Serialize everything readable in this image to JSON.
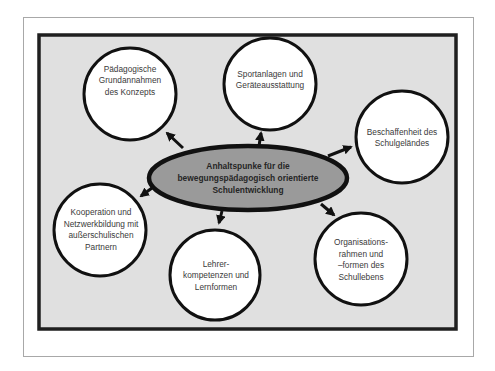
{
  "diagram": {
    "type": "mind-map",
    "colors": {
      "frame_border": "#a8a8a8",
      "panel_border": "#1f1f1f",
      "panel_fill": "#e0e0e0",
      "node_fill": "#ffffff",
      "node_stroke": "#111111",
      "center_fill": "#9a9a9a",
      "text": "#3a3a3a"
    },
    "center": {
      "label": "Anhaltspunke für die\nbewegungspädagogisch orientierte\nSchulentwicklung"
    },
    "nodes": [
      {
        "id": "paedagogische",
        "label": "Pädagogische\nGrundannahmen\ndes Konzepts"
      },
      {
        "id": "sportanlagen",
        "label": "Sportanlagen und\nGeräteausstattung"
      },
      {
        "id": "beschaffenheit",
        "label": "Beschaffenheit des\nSchulgeländes"
      },
      {
        "id": "kooperation",
        "label": "Kooperation und\nNetzwerkbildung mit\naußerschulischen\nPartnern"
      },
      {
        "id": "lehrer",
        "label": "Lehrer-\nkompetenzen und\nLernformen"
      },
      {
        "id": "organisation",
        "label": "Organisations-\nrahmen und\n–formen des\nSchullebens"
      }
    ],
    "edges": [
      {
        "from": "center",
        "to": "paedagogische"
      },
      {
        "from": "center",
        "to": "sportanlagen"
      },
      {
        "from": "center",
        "to": "beschaffenheit"
      },
      {
        "from": "center",
        "to": "kooperation"
      },
      {
        "from": "center",
        "to": "lehrer"
      },
      {
        "from": "center",
        "to": "organisation"
      }
    ]
  }
}
